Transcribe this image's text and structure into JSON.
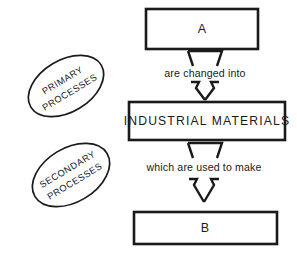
{
  "diagram": {
    "colors": {
      "stroke": "#1a1a1a",
      "fill": "#ffffff",
      "background": "#ffffff"
    },
    "boxes": [
      {
        "id": "box-a",
        "label": "A"
      },
      {
        "id": "box-industrial-materials",
        "label": "INDUSTRIAL MATERIALS"
      },
      {
        "id": "box-b",
        "label": "B"
      }
    ],
    "connectors": [
      {
        "id": "connector-1",
        "label": "are changed into",
        "from": "A",
        "to": "INDUSTRIAL MATERIALS"
      },
      {
        "id": "connector-2",
        "label": "which are used to make",
        "from": "INDUSTRIAL MATERIALS",
        "to": "B"
      }
    ],
    "ellipses": [
      {
        "id": "ellipse-primary",
        "line1": "PRIMARY",
        "line2": "PROCESSES"
      },
      {
        "id": "ellipse-secondary",
        "line1": "SECONDARY",
        "line2": "PROCESSES"
      }
    ]
  }
}
